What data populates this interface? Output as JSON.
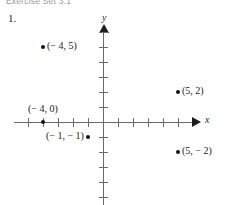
{
  "page": {
    "running_head": "Exercise Set 3.1",
    "exercise_number": "1."
  },
  "axes": {
    "x_label": "x",
    "y_label": "y"
  },
  "chart_data": {
    "type": "scatter",
    "title": "",
    "xlabel": "x",
    "ylabel": "y",
    "grid": false,
    "legend": null,
    "xlim": [
      -6,
      6
    ],
    "ylim": [
      -6,
      6
    ],
    "xtick_step": 1,
    "ytick_step": 1,
    "points": [
      {
        "label": "(− 4, 5)",
        "x": -4,
        "y": 5,
        "label_side": "right"
      },
      {
        "label": "(5, 2)",
        "x": 5,
        "y": 2,
        "label_side": "right"
      },
      {
        "label": "(− 4, 0)",
        "x": -4,
        "y": 0,
        "label_side": "above"
      },
      {
        "label": "(− 1, − 1)",
        "x": -1,
        "y": -1,
        "label_side": "left"
      },
      {
        "label": "(5, − 2)",
        "x": 5,
        "y": -2,
        "label_side": "right"
      }
    ]
  }
}
